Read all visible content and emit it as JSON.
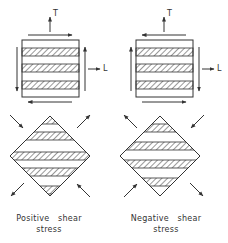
{
  "diagram": {
    "stroke_color": "#333333",
    "panels": [
      {
        "id": "positive",
        "caption_line1": "Positive   shear",
        "caption_line2": "stress",
        "axis_T": "T",
        "axis_L": "L",
        "square_shear": {
          "top": "right",
          "bottom": "left",
          "left": "down",
          "right": "up"
        },
        "diamond_arrows": {
          "top_left": "inward",
          "top_right": "outward",
          "bottom_left": "outward",
          "bottom_right": "inward"
        }
      },
      {
        "id": "negative",
        "caption_line1": "Negative   shear",
        "caption_line2": "stress",
        "axis_T": "T",
        "axis_L": "L",
        "square_shear": {
          "top": "left",
          "bottom": "right",
          "left": "up",
          "right": "down"
        },
        "diamond_arrows": {
          "top_left": "outward",
          "top_right": "inward",
          "bottom_left": "inward",
          "bottom_right": "outward"
        }
      }
    ]
  }
}
